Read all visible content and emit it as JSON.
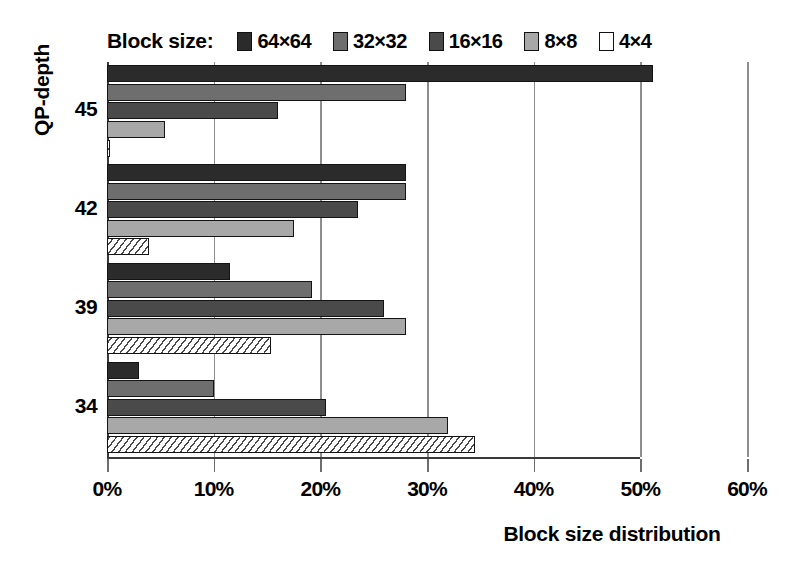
{
  "chart_data": {
    "type": "bar",
    "orientation": "horizontal",
    "title": "",
    "xlabel": "Block size distribution",
    "ylabel": "QP-depth",
    "categories": [
      "45",
      "42",
      "39",
      "34"
    ],
    "xlim": [
      0,
      60
    ],
    "xticks": [
      "0%",
      "10%",
      "20%",
      "30%",
      "40%",
      "50%",
      "60%"
    ],
    "xtick_values": [
      0,
      10,
      20,
      30,
      40,
      50,
      60
    ],
    "grid": true,
    "legend_position": "top",
    "legend_title": "Block size:",
    "series": [
      {
        "name": "64×64",
        "color": "#2b2b2b",
        "pattern": "solid",
        "values": [
          51.2,
          28.0,
          11.5,
          3.0
        ]
      },
      {
        "name": "32×32",
        "color": "#6e6e6e",
        "pattern": "solid",
        "values": [
          28.0,
          28.0,
          19.2,
          10.0
        ]
      },
      {
        "name": "16×16",
        "color": "#4a4a4a",
        "pattern": "solid",
        "values": [
          16.0,
          23.5,
          26.0,
          20.5
        ]
      },
      {
        "name": "8×8",
        "color": "#a8a8a8",
        "pattern": "solid",
        "values": [
          5.4,
          17.5,
          28.0,
          32.0
        ]
      },
      {
        "name": "4×4",
        "color": "#ffffff",
        "pattern": "diagonal-hatch",
        "values": [
          0.2,
          3.9,
          15.4,
          34.5
        ]
      }
    ]
  },
  "axes": {
    "y_title": "QP-depth",
    "x_title": "Block size distribution"
  },
  "colors": {
    "gridline": "#8d8d8d",
    "axis": "#3a3a3a",
    "bar_outline": "#141414",
    "background": "#ffffff"
  }
}
